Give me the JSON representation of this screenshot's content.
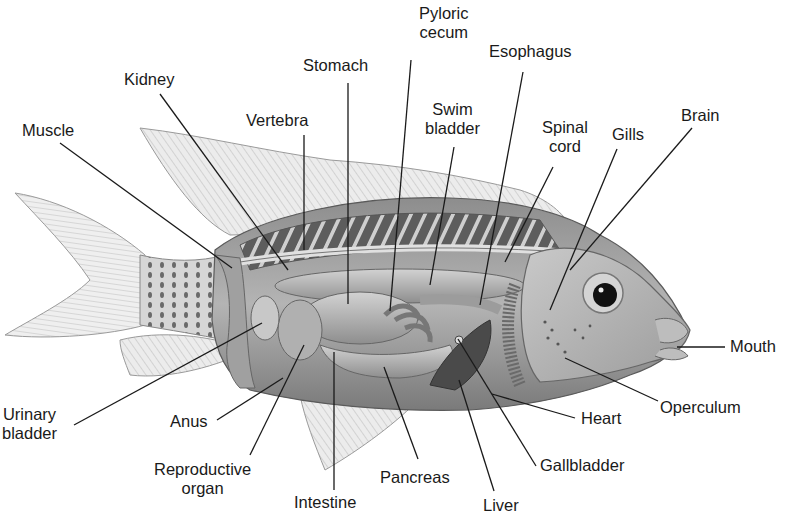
{
  "figure": {
    "top_fragment": "Opportunit",
    "colors": {
      "background": "#ffffff",
      "label_text": "#1a1a1a",
      "leader_line": "#1a1a1a",
      "body_shade": "#9a9a9a",
      "fin_shade": "#d8d8d8"
    }
  },
  "labels": [
    {
      "id": "pyloric-cecum",
      "text": "Pyloric\ncecum",
      "x": 419,
      "y": 4,
      "line": [
        [
          411,
          60
        ],
        [
          390,
          311
        ]
      ]
    },
    {
      "id": "esophagus",
      "text": "Esophagus",
      "x": 489,
      "y": 42,
      "line": [
        [
          523,
          72
        ],
        [
          480,
          305
        ]
      ]
    },
    {
      "id": "stomach",
      "text": "Stomach",
      "x": 303,
      "y": 56,
      "line": [
        [
          348,
          83
        ],
        [
          348,
          304
        ]
      ]
    },
    {
      "id": "kidney",
      "text": "Kidney",
      "x": 124,
      "y": 70,
      "line": [
        [
          160,
          94
        ],
        [
          288,
          270
        ]
      ]
    },
    {
      "id": "vertebra",
      "text": "Vertebra",
      "x": 246,
      "y": 111,
      "line": [
        [
          304,
          135
        ],
        [
          304,
          250
        ]
      ]
    },
    {
      "id": "swim-bladder",
      "text": "Swim\nbladder",
      "x": 425,
      "y": 100,
      "line": [
        [
          454,
          147
        ],
        [
          430,
          285
        ]
      ]
    },
    {
      "id": "brain",
      "text": "Brain",
      "x": 681,
      "y": 106,
      "line": [
        [
          692,
          128
        ],
        [
          570,
          270
        ]
      ]
    },
    {
      "id": "spinal-cord",
      "text": "Spinal\ncord",
      "x": 542,
      "y": 118,
      "line": [
        [
          553,
          167
        ],
        [
          505,
          262
        ]
      ]
    },
    {
      "id": "gills",
      "text": "Gills",
      "x": 612,
      "y": 125,
      "line": [
        [
          617,
          149
        ],
        [
          550,
          310
        ]
      ]
    },
    {
      "id": "muscle",
      "text": "Muscle",
      "x": 22,
      "y": 121,
      "line": [
        [
          60,
          143
        ],
        [
          232,
          268
        ]
      ]
    },
    {
      "id": "mouth",
      "text": "Mouth",
      "x": 730,
      "y": 337,
      "line": [
        [
          725,
          347
        ],
        [
          677,
          347
        ]
      ]
    },
    {
      "id": "operculum",
      "text": "Operculum",
      "x": 660,
      "y": 398,
      "line": [
        [
          658,
          401
        ],
        [
          565,
          358
        ]
      ]
    },
    {
      "id": "urinary-bladder",
      "text": "Urinary\nbladder",
      "x": 2,
      "y": 405,
      "line": [
        [
          74,
          425
        ],
        [
          262,
          323
        ]
      ]
    },
    {
      "id": "anus",
      "text": "Anus",
      "x": 170,
      "y": 412,
      "line": [
        [
          217,
          420
        ],
        [
          283,
          378
        ]
      ]
    },
    {
      "id": "heart",
      "text": "Heart",
      "x": 581,
      "y": 409,
      "line": [
        [
          575,
          418
        ],
        [
          492,
          394
        ]
      ]
    },
    {
      "id": "reproductive-organ",
      "text": "Reproductive\norgan",
      "x": 154,
      "y": 460,
      "line": [
        [
          250,
          455
        ],
        [
          304,
          345
        ]
      ]
    },
    {
      "id": "gallbladder",
      "text": "Gallbladder",
      "x": 540,
      "y": 456,
      "line": [
        [
          536,
          466
        ],
        [
          458,
          339
        ]
      ]
    },
    {
      "id": "pancreas",
      "text": "Pancreas",
      "x": 380,
      "y": 468,
      "line": [
        [
          418,
          459
        ],
        [
          384,
          367
        ]
      ]
    },
    {
      "id": "intestine",
      "text": "Intestine",
      "x": 294,
      "y": 493,
      "line": [
        [
          334,
          490
        ],
        [
          334,
          352
        ]
      ]
    },
    {
      "id": "liver",
      "text": "Liver",
      "x": 483,
      "y": 496,
      "line": [
        [
          494,
          491
        ],
        [
          459,
          380
        ]
      ]
    }
  ]
}
